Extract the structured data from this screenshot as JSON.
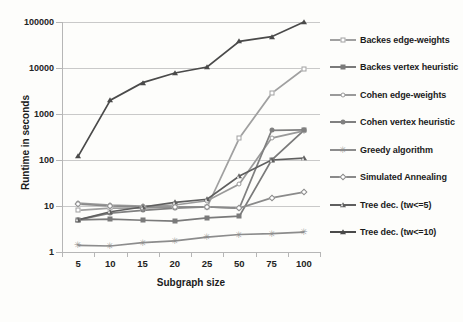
{
  "chart_data": {
    "type": "line",
    "title": "",
    "xlabel": "Subgraph size",
    "ylabel": "Runtime in seconds",
    "yscale": "log",
    "ylim": [
      1,
      100000
    ],
    "ytick_labels": [
      "1",
      "10",
      "100",
      "1000",
      "10000",
      "100000"
    ],
    "categories": [
      "5",
      "10",
      "15",
      "20",
      "25",
      "50",
      "75",
      "100"
    ],
    "grid": "horizontal",
    "legend_position": "right",
    "series": [
      {
        "name": "Backes edge-weights",
        "marker": "open-square",
        "color": "#a0a0a0",
        "values": [
          8.0,
          9.0,
          9.0,
          9.5,
          9.5,
          300,
          2800,
          9500
        ]
      },
      {
        "name": "Backes vertex heuristic",
        "marker": "filled-square",
        "color": "#7a7a7a",
        "values": [
          5.0,
          5.2,
          4.9,
          4.7,
          5.5,
          6.0,
          100,
          440
        ]
      },
      {
        "name": "Cohen edge-weights",
        "marker": "open-circle",
        "color": "#9a9a9a",
        "values": [
          11.5,
          10.5,
          10.0,
          10.5,
          13.0,
          30.0,
          300,
          430
        ]
      },
      {
        "name": "Cohen vertex heuristic",
        "marker": "filled-circle",
        "color": "#808080",
        "values": [
          5.0,
          7.0,
          8.0,
          9.0,
          9.5,
          9.0,
          440,
          450
        ]
      },
      {
        "name": "Greedy algorithm",
        "marker": "asterisk",
        "color": "#8c8c8c",
        "values": [
          1.4,
          1.35,
          1.6,
          1.75,
          2.1,
          2.4,
          2.5,
          2.7
        ]
      },
      {
        "name": "Simulated Annealing",
        "marker": "open-diamond",
        "color": "#8a8a8a",
        "values": [
          11.0,
          10.0,
          9.5,
          9.5,
          9.5,
          9.0,
          15.0,
          20.0
        ]
      },
      {
        "name": "Tree dec. (tw<=5)",
        "marker": "open-triangle",
        "color": "#5f5f5f",
        "values": [
          5.0,
          7.5,
          9.5,
          12.0,
          14.0,
          45.0,
          100,
          110
        ]
      },
      {
        "name": "Tree dec. (tw<=10)",
        "marker": "filled-triangle",
        "color": "#4a4a4a",
        "values": [
          120,
          2000,
          4800,
          7800,
          10500,
          38000,
          48000,
          100000
        ]
      }
    ]
  }
}
